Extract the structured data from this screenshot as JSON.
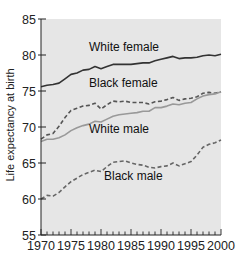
{
  "chart_data": {
    "type": "line",
    "title": "",
    "xlabel": "",
    "ylabel": "Life expectancy at birth",
    "xlim": [
      1970,
      2000
    ],
    "ylim": [
      55,
      85
    ],
    "x_ticks": [
      1970,
      1975,
      1980,
      1985,
      1990,
      1995,
      2000
    ],
    "y_ticks": [
      55,
      60,
      65,
      70,
      75,
      80,
      85
    ],
    "grid": false,
    "legend": "inline labels",
    "background": "#e6e6e6",
    "x": [
      1970,
      1971,
      1972,
      1973,
      1974,
      1975,
      1976,
      1977,
      1978,
      1979,
      1980,
      1981,
      1982,
      1983,
      1984,
      1985,
      1986,
      1987,
      1988,
      1989,
      1990,
      1991,
      1992,
      1993,
      1994,
      1995,
      1996,
      1997,
      1998,
      1999,
      2000
    ],
    "series": [
      {
        "name": "White female",
        "style": "solid",
        "color": "#333333",
        "label_pos": [
          1978,
          80.6
        ],
        "values": [
          75.6,
          75.8,
          75.9,
          76.1,
          76.7,
          77.3,
          77.5,
          77.9,
          78.0,
          78.4,
          78.1,
          78.4,
          78.7,
          78.7,
          78.7,
          78.7,
          78.8,
          78.9,
          78.9,
          79.2,
          79.4,
          79.6,
          79.8,
          79.5,
          79.6,
          79.6,
          79.7,
          79.9,
          80.0,
          79.9,
          80.1
        ]
      },
      {
        "name": "Black female",
        "style": "dashed",
        "color": "#555555",
        "label_pos": [
          1978,
          75.6
        ],
        "values": [
          68.3,
          68.9,
          69.1,
          70.1,
          71.3,
          72.3,
          72.6,
          72.9,
          73.0,
          73.3,
          72.5,
          73.1,
          73.6,
          73.5,
          73.6,
          73.4,
          73.4,
          73.4,
          73.2,
          73.5,
          73.6,
          73.8,
          74.1,
          73.7,
          73.9,
          74.0,
          74.2,
          74.7,
          74.8,
          74.7,
          74.9
        ]
      },
      {
        "name": "White male",
        "style": "solid",
        "color": "#999999",
        "label_pos": [
          1978,
          69.1
        ],
        "values": [
          68.0,
          68.3,
          68.3,
          68.5,
          68.9,
          69.5,
          69.9,
          70.2,
          70.4,
          70.8,
          70.7,
          71.1,
          71.5,
          71.7,
          71.8,
          71.9,
          72.0,
          72.2,
          72.2,
          72.7,
          72.7,
          72.9,
          73.2,
          73.1,
          73.3,
          73.4,
          73.9,
          74.3,
          74.5,
          74.6,
          74.9
        ]
      },
      {
        "name": "Black male",
        "style": "dashed",
        "color": "#666666",
        "label_pos": [
          1980.5,
          62.6
        ],
        "values": [
          60.0,
          60.5,
          60.4,
          60.9,
          61.7,
          62.4,
          62.9,
          63.4,
          63.7,
          64.0,
          63.8,
          64.5,
          65.1,
          65.2,
          65.3,
          65.0,
          64.8,
          64.7,
          64.4,
          64.3,
          64.5,
          64.6,
          65.0,
          64.6,
          64.9,
          65.2,
          66.1,
          67.2,
          67.6,
          67.8,
          68.2
        ]
      }
    ]
  }
}
